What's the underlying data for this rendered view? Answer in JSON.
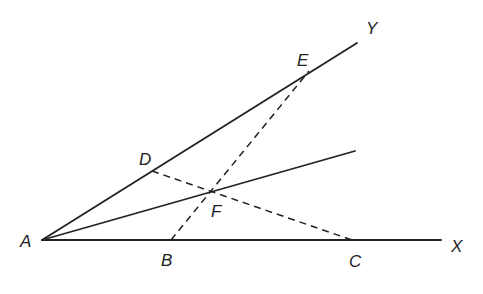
{
  "diagram": {
    "stroke_color": "#222222",
    "background": "#ffffff",
    "points": {
      "A": {
        "label": "A",
        "x": 42,
        "y": 240,
        "lx": 20,
        "ly": 247
      },
      "B": {
        "label": "B",
        "x": 171,
        "y": 240,
        "lx": 161,
        "ly": 266
      },
      "C": {
        "label": "C",
        "x": 352,
        "y": 240,
        "lx": 349,
        "ly": 267
      },
      "D": {
        "label": "D",
        "x": 152,
        "y": 171,
        "lx": 139,
        "ly": 165
      },
      "E": {
        "label": "E",
        "x": 309,
        "y": 71,
        "lx": 297,
        "ly": 66
      },
      "F": {
        "label": "F",
        "x": 211,
        "y": 192,
        "lx": 211,
        "ly": 217
      },
      "X": {
        "label": "X",
        "x": 441,
        "y": 240,
        "lx": 451,
        "ly": 252
      },
      "Y": {
        "label": "Y",
        "x": 357,
        "y": 43,
        "lx": 366,
        "ly": 34
      }
    },
    "bisector_end": {
      "x": 355,
      "y": 151
    },
    "segments": [
      {
        "name": "ray-AX",
        "from": "A",
        "to": "X",
        "style": "solid"
      },
      {
        "name": "ray-AY",
        "from": "A",
        "to": "Y",
        "style": "solid"
      },
      {
        "name": "bisector-AF",
        "from": "A",
        "to": "bisector_end",
        "style": "solid"
      },
      {
        "name": "segment-BE",
        "from": "B",
        "to": "E",
        "style": "dashed"
      },
      {
        "name": "segment-DC",
        "from": "D",
        "to": "C",
        "style": "dashed"
      }
    ]
  }
}
